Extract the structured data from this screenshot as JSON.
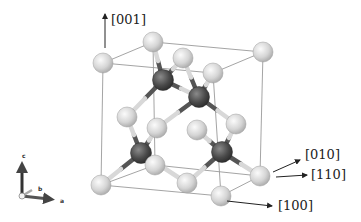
{
  "figure": {
    "colors": {
      "cell_edge": "#9a9a9a",
      "bond_light": "#d8d8d8",
      "bond_dark": "#555555",
      "light_atom": "#dcdcdc",
      "dark_atom": "#4a4a4a",
      "arrow": "#222222"
    },
    "cell_edges": [
      [
        103,
        63,
        153,
        42
      ],
      [
        153,
        42,
        263,
        52
      ],
      [
        103,
        63,
        213,
        73
      ],
      [
        213,
        73,
        263,
        52
      ],
      [
        103,
        63,
        101,
        185
      ],
      [
        153,
        42,
        155,
        165
      ],
      [
        263,
        52,
        260,
        176
      ],
      [
        213,
        73,
        221,
        196
      ],
      [
        101,
        185,
        155,
        165
      ],
      [
        155,
        165,
        260,
        176
      ],
      [
        101,
        185,
        221,
        196
      ],
      [
        221,
        196,
        260,
        176
      ]
    ],
    "bonds": [
      [
        163,
        80,
        153,
        42
      ],
      [
        163,
        80,
        183,
        58
      ],
      [
        163,
        80,
        127,
        117
      ],
      [
        163,
        80,
        199,
        97
      ],
      [
        199,
        97,
        213,
        73
      ],
      [
        199,
        97,
        183,
        58
      ],
      [
        199,
        97,
        157,
        128
      ],
      [
        199,
        97,
        236,
        124
      ],
      [
        141,
        153,
        127,
        117
      ],
      [
        141,
        153,
        157,
        128
      ],
      [
        141,
        153,
        101,
        185
      ],
      [
        141,
        153,
        187,
        183
      ],
      [
        222,
        152,
        236,
        124
      ],
      [
        222,
        152,
        187,
        183
      ],
      [
        222,
        152,
        260,
        176
      ],
      [
        222,
        152,
        197,
        130
      ]
    ],
    "light_atoms": [
      [
        103,
        63
      ],
      [
        153,
        42
      ],
      [
        263,
        52
      ],
      [
        183,
        58
      ],
      [
        213,
        73
      ],
      [
        127,
        117
      ],
      [
        157,
        128
      ],
      [
        197,
        130
      ],
      [
        236,
        124
      ],
      [
        101,
        185
      ],
      [
        155,
        165
      ],
      [
        187,
        183
      ],
      [
        221,
        196
      ],
      [
        260,
        176
      ]
    ],
    "dark_atoms": [
      [
        163,
        80
      ],
      [
        199,
        97
      ],
      [
        141,
        153
      ],
      [
        222,
        152
      ]
    ],
    "directions": [
      {
        "label": "[001]",
        "x1": 105,
        "y1": 48,
        "x2": 105,
        "y2": 14,
        "tx": 111,
        "ty": 13
      },
      {
        "label": "[010]",
        "x1": 273,
        "y1": 172,
        "x2": 300,
        "y2": 160,
        "tx": 305,
        "ty": 148
      },
      {
        "label": "[110]",
        "x1": 276,
        "y1": 177,
        "x2": 307,
        "y2": 175,
        "tx": 311,
        "ty": 168
      },
      {
        "label": "[100]",
        "x1": 227,
        "y1": 201,
        "x2": 272,
        "y2": 206,
        "tx": 278,
        "ty": 199
      }
    ],
    "axes_indicator": {
      "labels": {
        "c": "c",
        "b": "b",
        "a": "a"
      }
    }
  }
}
